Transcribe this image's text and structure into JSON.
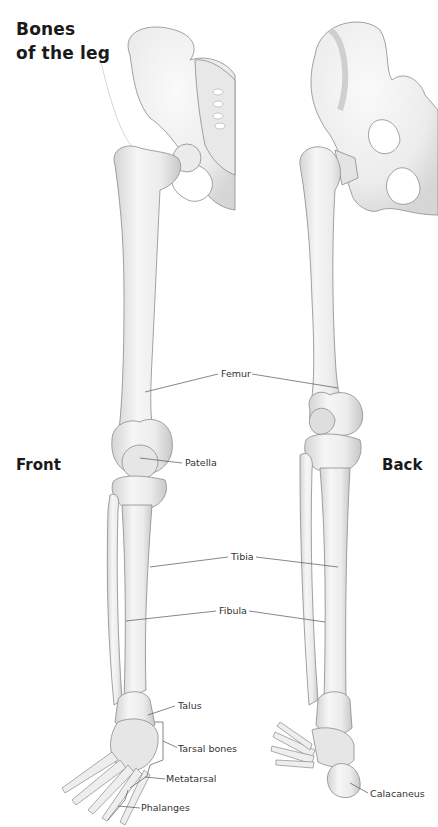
{
  "title": {
    "line1": "Bones",
    "line2": "of the leg"
  },
  "views": {
    "front": "Front",
    "back": "Back"
  },
  "labels": {
    "femur": "Femur",
    "patella": "Patella",
    "tibia": "Tibia",
    "fibula": "Fibula",
    "talus": "Talus",
    "tarsal": "Tarsal bones",
    "metatarsal": "Metatarsal",
    "phalanges": "Phalanges",
    "calcaneus": "Calacaneus"
  },
  "colors": {
    "bone_fill": "#f1f1f1",
    "bone_stroke": "#8a8a8a",
    "leader": "#555555",
    "text": "#1a1a1a"
  }
}
